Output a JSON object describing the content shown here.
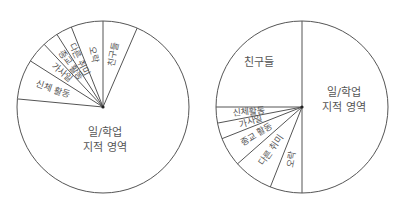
{
  "colors": {
    "stroke": "#555555",
    "fill": "#ffffff",
    "text": "#555555"
  },
  "chart_data": [
    {
      "type": "pie",
      "title": "",
      "start_angle_deg": 90,
      "direction": "counterclockwise-from-top-for-small-slices",
      "center": [
        103,
        107
      ],
      "radius": 86,
      "slices": [
        {
          "label": "일/학업 지적 영역",
          "lines": [
            "일/학업",
            "지적 영역"
          ],
          "value": 70,
          "label_mode": "horizontal",
          "label_pos": [
            105,
            136
          ]
        },
        {
          "label": "친구들",
          "lines": [
            "친구들"
          ],
          "value": 6.5,
          "label_mode": "radial"
        },
        {
          "label": "오락",
          "lines": [
            "오락"
          ],
          "value": 6,
          "label_mode": "radial"
        },
        {
          "label": "다른 취미",
          "lines": [
            "다른 취미"
          ],
          "value": 3,
          "label_mode": "radial"
        },
        {
          "label": "종교 활동",
          "lines": [
            "종교 활동"
          ],
          "value": 3,
          "label_mode": "radial"
        },
        {
          "label": "가사일",
          "lines": [
            "가사일"
          ],
          "value": 4,
          "label_mode": "radial"
        },
        {
          "label": "신체 활동",
          "lines": [
            "신체 활동"
          ],
          "value": 7.5,
          "label_mode": "radial"
        }
      ]
    },
    {
      "type": "pie",
      "title": "",
      "center": [
        302,
        107
      ],
      "radius": 86,
      "slices": [
        {
          "label": "일/학업 지적 영역",
          "lines": [
            "일/학업",
            "지적 영역"
          ],
          "value": 50,
          "label_mode": "horizontal",
          "label_pos": [
            344,
            96
          ]
        },
        {
          "label": "친구들",
          "lines": [
            "친구들"
          ],
          "value": 25,
          "label_mode": "horizontal",
          "label_pos": [
            259,
            66
          ]
        },
        {
          "label": "신체활동",
          "lines": [
            "신체활동"
          ],
          "value": 3,
          "label_mode": "radial"
        },
        {
          "label": "가사일",
          "lines": [
            "가사일"
          ],
          "value": 3,
          "label_mode": "radial"
        },
        {
          "label": "종교 활동",
          "lines": [
            "종교 활동"
          ],
          "value": 5.5,
          "label_mode": "radial"
        },
        {
          "label": "다른 취미",
          "lines": [
            "다른 취미"
          ],
          "value": 7.5,
          "label_mode": "radial"
        },
        {
          "label": "오락",
          "lines": [
            "오락"
          ],
          "value": 6,
          "label_mode": "radial"
        }
      ]
    }
  ]
}
